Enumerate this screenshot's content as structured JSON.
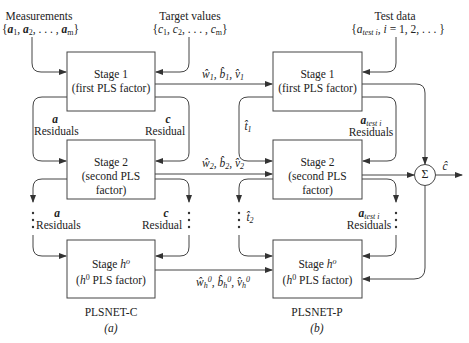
{
  "left_network": {
    "name": "PLSNET-C",
    "caption": "(a)",
    "inputs": {
      "measurements_title": "Measurements",
      "measurements_set": "{a1, a2, . . . , am}",
      "target_title": "Target values",
      "target_set": "{c1, c2, . . . , cm}"
    },
    "stages": [
      {
        "title": "Stage 1",
        "subtitle": "(first PLS factor)"
      },
      {
        "title": "Stage 2",
        "subtitle": "(second PLS factor)"
      },
      {
        "title": "Stage h°",
        "subtitle": "(h⁰ PLS factor)"
      }
    ],
    "residual_labels": {
      "a_symbol": "a",
      "a_label": "Residuals",
      "c_symbol": "c",
      "c_label": "Residual"
    }
  },
  "right_network": {
    "name": "PLSNET-P",
    "caption": "(b)",
    "inputs": {
      "test_title": "Test data",
      "test_set": "{a test i, i = 1, 2, . . . }"
    },
    "stages": [
      {
        "title": "Stage 1",
        "subtitle": "(first PLS factor)"
      },
      {
        "title": "Stage 2",
        "subtitle": "(second PLS factor)"
      },
      {
        "title": "Stage h°",
        "subtitle": "(h⁰ PLS factor)"
      }
    ],
    "residual_labels": {
      "t1": "t̂1",
      "t2": "t̂2",
      "a_test_symbol": "a test i",
      "a_test_label": "Residuals"
    },
    "summation": {
      "symbol": "Σ",
      "output": "ĉ"
    }
  },
  "connections": [
    {
      "label": "ŵ1, b̂1, v̂1"
    },
    {
      "label": "ŵ2, b̂2, v̂2"
    },
    {
      "label": "ŵh⁰, b̂h⁰, v̂h⁰"
    }
  ]
}
